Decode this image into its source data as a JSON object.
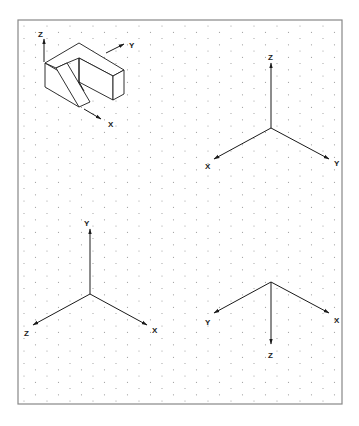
{
  "sheet": {
    "frame": {
      "x": 18,
      "y": 20,
      "width": 324,
      "height": 384,
      "border_color": "#888888"
    },
    "dot_grid": {
      "type": "isometric",
      "col_spacing": 11.5,
      "row_spacing": 12.5,
      "dot_color": "#9a9a9a"
    }
  },
  "object_sketch": {
    "description": "isometric block with slot",
    "axis_labels": {
      "z": "Z",
      "y": "Y",
      "x": "X"
    }
  },
  "axis_sets": [
    {
      "id": "top-right",
      "labels": {
        "z": "Z",
        "x": "X",
        "y": "Y"
      },
      "orientation": "Z up, X lower-left, Y lower-right"
    },
    {
      "id": "bottom-left",
      "labels": {
        "y": "Y",
        "z": "Z",
        "x": "X"
      },
      "orientation": "Y up, Z lower-left, X lower-right"
    },
    {
      "id": "bottom-right",
      "labels": {
        "y": "Y",
        "x": "X",
        "z": "Z"
      },
      "orientation": "Y upper-left, X upper-right, Z down"
    }
  ]
}
